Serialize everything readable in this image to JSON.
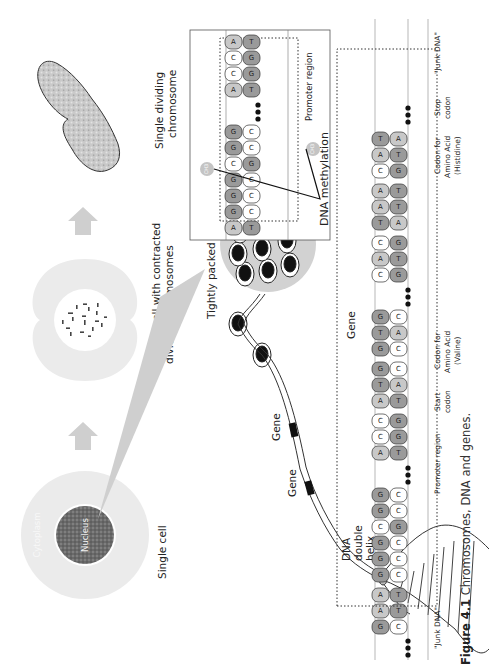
{
  "figure": {
    "caption_label": "Figure 4.1",
    "caption_text": "Chromosomes, DNA and genes.",
    "orientation": "rotated 90° counterclockwise (landscape figure on portrait page)"
  },
  "stages": {
    "single_cell": {
      "label": "Single cell",
      "cytoplasm_label": "Cytoplasm",
      "nucleus_label": "Nucleus"
    },
    "dividing_cell": {
      "label_line1": "Dividing cell with contracted",
      "label_line2": "dividing chromosomes"
    },
    "chromosome": {
      "label_line1": "Single dividing",
      "label_line2": "chromosome"
    }
  },
  "dna_labels": {
    "tightly_packed": "Tightly packed DNA",
    "gene_1": "Gene",
    "gene_2": "Gene",
    "double_helix_line1": "DNA",
    "double_helix_line2": "double",
    "double_helix_line3": "helix"
  },
  "methylation_box": {
    "title": "DNA methylation",
    "region_label": "Promoter region",
    "methyl_group": "CH3",
    "top_strand": [
      "A",
      "G",
      "G",
      "G",
      "C",
      "G",
      "G",
      "...",
      "A",
      "C",
      "C",
      "A"
    ],
    "bottom_strand": [
      "T",
      "C",
      "C",
      "C",
      "G",
      "C",
      "C",
      "...",
      "T",
      "G",
      "G",
      "T"
    ]
  },
  "gene_strip": {
    "gene_label": "Gene",
    "segments": [
      {
        "label": "\"Junk DNA\"",
        "top": [
          "G",
          "A",
          "A"
        ],
        "bottom": [
          "C",
          "T",
          "T"
        ]
      },
      {
        "label": "",
        "top": [
          "G",
          "G",
          "G",
          "C",
          "G",
          "G"
        ],
        "bottom": [
          "C",
          "C",
          "C",
          "G",
          "C",
          "C"
        ]
      },
      {
        "label": "Promoter region",
        "top": [
          "A",
          "C",
          "C"
        ],
        "bottom": [
          "T",
          "G",
          "G"
        ]
      },
      {
        "label": "Start codon",
        "top": [
          "A",
          "T",
          "G"
        ],
        "bottom": [
          "T",
          "A",
          "C"
        ]
      },
      {
        "label": "Codon for Amino Acid (Valine)",
        "top": [
          "G",
          "T",
          "G"
        ],
        "bottom": [
          "C",
          "A",
          "C"
        ]
      },
      {
        "label": "Codon for Amino Acid (Histidine)",
        "top": [
          "C",
          "A",
          "C"
        ],
        "bottom": [
          "G",
          "T",
          "G"
        ]
      },
      {
        "label": "Stop codon",
        "top": [
          "T",
          "A",
          "A"
        ],
        "bottom": [
          "A",
          "T",
          "T"
        ]
      },
      {
        "label": "\"Junk DNA\"",
        "top": [
          "C",
          "A",
          "T"
        ],
        "bottom": [
          "G",
          "T",
          "A"
        ]
      }
    ],
    "labels": {
      "junk_left": "\"Junk DNA\"",
      "promoter": "Promoter region",
      "start_1": "Start",
      "start_2": "codon",
      "valine_1": "Codon for",
      "valine_2": "Amino Acid",
      "valine_3": "(Valine)",
      "hist_1": "Codon for",
      "hist_2": "Amino Acid",
      "hist_3": "(Histidine)",
      "stop_1": "Stop",
      "stop_2": "codon",
      "junk_right": "\"Junk DNA\""
    }
  },
  "colors": {
    "purine_fill": "#9a9a9a",
    "light_base_fill": "#c8c8c8",
    "white_base_fill": "#ffffff",
    "cell_fill": "#e6e6e6",
    "arrow_fill": "#cfcfcf",
    "text": "#222222"
  }
}
